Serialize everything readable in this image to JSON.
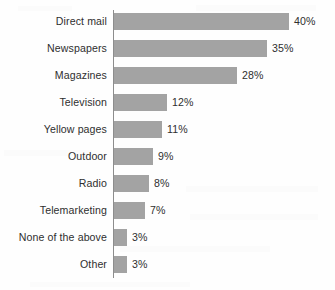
{
  "chart_data": {
    "type": "bar",
    "orientation": "horizontal",
    "title": "",
    "subtitle": "",
    "xlabel": "",
    "ylabel": "",
    "grid": false,
    "legend": false,
    "legend_position": "none",
    "xlim": [
      0,
      40
    ],
    "value_suffix": "%",
    "bar_color": "#a3a3a3",
    "axis_color": "#8d8d8d",
    "text_color": "#2f2f2f",
    "background_color": "#fefefe",
    "categories": [
      "Direct mail",
      "Newspapers",
      "Magazines",
      "Television",
      "Yellow pages",
      "Outdoor",
      "Radio",
      "Telemarketing",
      "None of the above",
      "Other"
    ],
    "values": [
      40,
      35,
      28,
      12,
      11,
      9,
      8,
      7,
      3,
      3
    ],
    "value_labels": [
      "40%",
      "35%",
      "28%",
      "12%",
      "11%",
      "9%",
      "8%",
      "7%",
      "3%",
      "3%"
    ]
  }
}
